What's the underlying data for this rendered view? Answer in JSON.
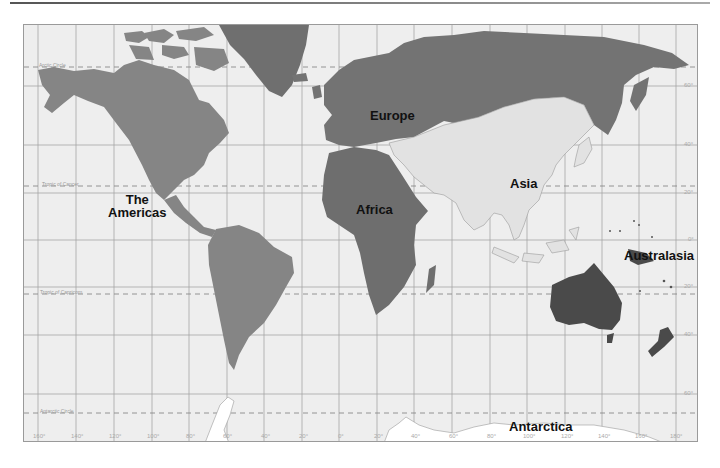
{
  "map": {
    "type": "world-regions-map",
    "colors": {
      "ocean": "#eeeeee",
      "americas": "#858585",
      "europe": "#737373",
      "africa": "#6e6e6e",
      "asia": "#e2e2e2",
      "australasia": "#4a4a4a",
      "antarctica": "#ffffff",
      "grid": "#9a9a9a"
    },
    "regions": [
      {
        "id": "americas",
        "label": "The\nAmericas",
        "line1": "The",
        "line2": "Americas"
      },
      {
        "id": "europe",
        "label": "Europe"
      },
      {
        "id": "africa",
        "label": "Africa"
      },
      {
        "id": "asia",
        "label": "Asia"
      },
      {
        "id": "australasia",
        "label": "Australasia"
      },
      {
        "id": "antarctica",
        "label": "Antarctica"
      }
    ],
    "special_lines": {
      "arctic": "Arctic Circle",
      "cancer": "Tropic of Cancer",
      "capricorn": "Tropic of Capricorn",
      "antarctic": "Antarctic Circle"
    },
    "latitude_labels": [
      "60°",
      "40°",
      "20°",
      "0°",
      "20°",
      "40°",
      "60°"
    ],
    "longitude_labels": [
      "160°",
      "140°",
      "120°",
      "100°",
      "80°",
      "60°",
      "40°",
      "20°",
      "0°",
      "20°",
      "40°",
      "60°",
      "80°",
      "100°",
      "120°",
      "140°",
      "160°",
      "180°"
    ]
  }
}
